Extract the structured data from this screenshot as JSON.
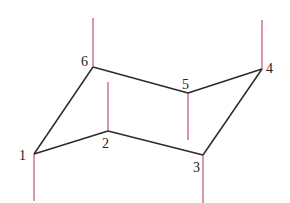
{
  "diagram": {
    "bond_color": "#2a2a2a",
    "axial_color": "#c0506a",
    "atoms": [
      {
        "id": "1",
        "label": "1",
        "x": 34,
        "y": 154,
        "lx": 19,
        "ly": 160
      },
      {
        "id": "2",
        "label": "2",
        "x": 108,
        "y": 131,
        "lx": 102,
        "ly": 148
      },
      {
        "id": "3",
        "label": "3",
        "x": 203,
        "y": 155,
        "lx": 193,
        "ly": 172
      },
      {
        "id": "4",
        "label": "4",
        "x": 262,
        "y": 69,
        "lx": 266,
        "ly": 73
      },
      {
        "id": "5",
        "label": "5",
        "x": 188,
        "y": 93,
        "lx": 182,
        "ly": 89
      },
      {
        "id": "6",
        "label": "6",
        "x": 93,
        "y": 67,
        "lx": 81,
        "ly": 66
      }
    ],
    "axial_bonds": [
      {
        "atom": "6",
        "direction": "up",
        "y2": 18
      },
      {
        "atom": "2",
        "direction": "up",
        "y2": 82
      },
      {
        "atom": "4",
        "direction": "up",
        "y2": 20
      },
      {
        "atom": "1",
        "direction": "down",
        "y2": 201
      },
      {
        "atom": "5",
        "direction": "down",
        "y2": 140
      },
      {
        "atom": "3",
        "direction": "down",
        "y2": 203
      }
    ]
  }
}
